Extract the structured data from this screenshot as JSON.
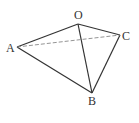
{
  "diagram": {
    "type": "tetrahedron",
    "vertices": [
      {
        "id": "O",
        "label": "O",
        "x": 78,
        "y": 24,
        "lx": 74,
        "ly": 19
      },
      {
        "id": "A",
        "label": "A",
        "x": 17,
        "y": 47,
        "lx": 6,
        "ly": 52
      },
      {
        "id": "C",
        "label": "C",
        "x": 120,
        "y": 35,
        "lx": 122,
        "ly": 40
      },
      {
        "id": "B",
        "label": "B",
        "x": 92,
        "y": 93,
        "lx": 88,
        "ly": 105
      }
    ],
    "edges": [
      {
        "from": "O",
        "to": "A",
        "style": "solid"
      },
      {
        "from": "O",
        "to": "C",
        "style": "solid"
      },
      {
        "from": "O",
        "to": "B",
        "style": "solid"
      },
      {
        "from": "A",
        "to": "B",
        "style": "solid"
      },
      {
        "from": "C",
        "to": "B",
        "style": "solid"
      },
      {
        "from": "A",
        "to": "C",
        "style": "dashed"
      }
    ],
    "colors": {
      "solid": "#333333",
      "dashed": "#888888",
      "label": "#333333"
    }
  }
}
